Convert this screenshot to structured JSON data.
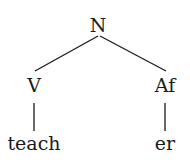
{
  "tree": {
    "root": {
      "label": "N"
    },
    "left": {
      "label": "V",
      "leaf": "teach"
    },
    "right": {
      "label": "Af",
      "leaf": "er"
    }
  }
}
